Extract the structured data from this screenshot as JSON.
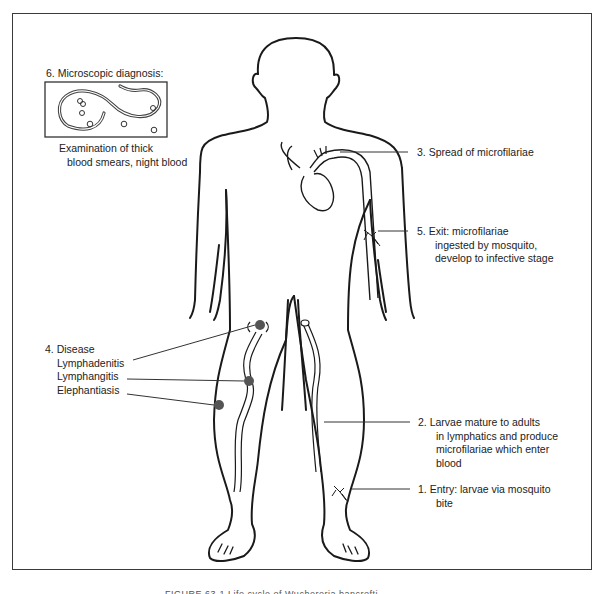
{
  "figure": {
    "caption": "FIGURE 63-1 Life cycle of Wuchereria bancrofti"
  },
  "labels": {
    "microscopic": {
      "title": "6. Microscopic diagnosis:",
      "line1": "Examination of thick",
      "line2": "blood smears, night blood"
    },
    "spread": {
      "title": "3. Spread of microfilariae"
    },
    "exit": {
      "title": "5. Exit: microfilariae",
      "line1": "ingested by mosquito,",
      "line2": "develop to infective stage"
    },
    "disease": {
      "title": "4. Disease",
      "items": [
        "Lymphadenitis",
        "Lymphangitis",
        "Elephantiasis"
      ]
    },
    "larvae": {
      "title": "2. Larvae mature to adults",
      "line1": "in lymphatics and produce",
      "line2": "microfilariae which enter",
      "line3": "blood"
    },
    "entry": {
      "title": "1. Entry: larvae via mosquito",
      "line1": "bite"
    }
  },
  "colors": {
    "line": "#1a1a1a",
    "lesion": "#555555",
    "frame": "#3a3a3a"
  }
}
